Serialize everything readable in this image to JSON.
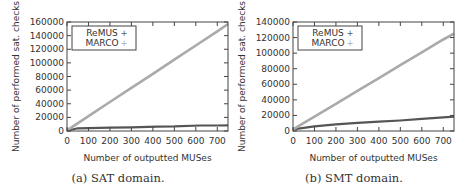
{
  "chart_data": [
    {
      "type": "line",
      "title": "",
      "caption": "(a) SAT domain.",
      "xlabel": "Number of outputted MUSes",
      "ylabel": "Number of performed sat. checks",
      "xlim": [
        0,
        750
      ],
      "ylim": [
        0,
        160000
      ],
      "xticks": [
        0,
        100,
        200,
        300,
        400,
        500,
        600,
        700
      ],
      "yticks": [
        0,
        20000,
        40000,
        60000,
        80000,
        100000,
        120000,
        140000,
        160000
      ],
      "grid": false,
      "legend_position": "upper left",
      "series": [
        {
          "name": "ReMUS",
          "color": "#555555",
          "x": [
            0,
            50,
            100,
            200,
            300,
            420,
            500,
            620,
            700,
            750
          ],
          "y": [
            500,
            4000,
            4200,
            4800,
            5500,
            6500,
            6700,
            8000,
            8100,
            8200
          ]
        },
        {
          "name": "MARCO",
          "color": "#aaaaaa",
          "x": [
            0,
            100,
            200,
            300,
            400,
            500,
            600,
            700,
            750
          ],
          "y": [
            1000,
            21800,
            42500,
            63300,
            84000,
            104800,
            125500,
            146300,
            157000
          ]
        }
      ]
    },
    {
      "type": "line",
      "title": "",
      "caption": "(b) SMT domain.",
      "xlabel": "Number of outputted MUSes",
      "ylabel": "Number of performed sat. checks",
      "xlim": [
        0,
        750
      ],
      "ylim": [
        0,
        140000
      ],
      "xticks": [
        0,
        100,
        200,
        300,
        400,
        500,
        600,
        700
      ],
      "yticks": [
        0,
        20000,
        40000,
        60000,
        80000,
        100000,
        120000,
        140000
      ],
      "grid": false,
      "legend_position": "upper left",
      "series": [
        {
          "name": "ReMUS",
          "color": "#555555",
          "x": [
            0,
            100,
            200,
            300,
            400,
            500,
            600,
            700,
            750
          ],
          "y": [
            2000,
            6000,
            8500,
            10500,
            12000,
            13500,
            15500,
            17500,
            18500
          ]
        },
        {
          "name": "MARCO",
          "color": "#aaaaaa",
          "x": [
            0,
            100,
            200,
            300,
            400,
            500,
            600,
            700,
            750
          ],
          "y": [
            2000,
            18500,
            35000,
            51500,
            68000,
            84500,
            101000,
            117500,
            125000
          ]
        }
      ]
    }
  ]
}
